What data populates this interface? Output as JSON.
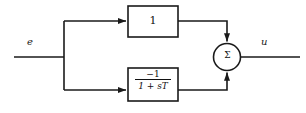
{
  "diagram": {
    "stroke_color": "#1a1a1a",
    "background_color": "#ffffff",
    "signals": {
      "input_label": "e",
      "output_label": "u"
    },
    "blocks": [
      {
        "name": "gain-block",
        "text": "1",
        "kind": "gain",
        "x": 128,
        "y": 6,
        "w": 50,
        "h": 31
      },
      {
        "name": "lag-block",
        "kind": "transfer-function",
        "numerator": "−1",
        "denominator": "1 + sT",
        "x": 128,
        "y": 68,
        "w": 50,
        "h": 33
      }
    ],
    "summing_junction": {
      "name": "summing-junction",
      "symbol": "Σ",
      "cx": 227,
      "cy": 57,
      "r": 13.5
    },
    "branch_node": {
      "x": 64,
      "y": 57
    },
    "wires": [
      {
        "name": "input-wire",
        "from": "input",
        "to": "branch-node"
      },
      {
        "name": "branch-to-gain-wire",
        "from": "branch-node",
        "to": "gain-block"
      },
      {
        "name": "branch-to-lag-wire",
        "from": "branch-node",
        "to": "lag-block"
      },
      {
        "name": "gain-to-sum-wire",
        "from": "gain-block",
        "to": "summing-junction"
      },
      {
        "name": "lag-to-sum-wire",
        "from": "lag-block",
        "to": "summing-junction"
      },
      {
        "name": "output-wire",
        "from": "summing-junction",
        "to": "output"
      }
    ]
  }
}
